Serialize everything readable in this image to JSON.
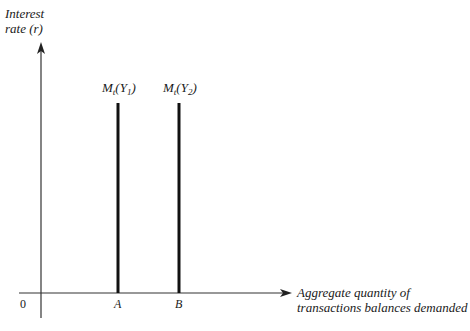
{
  "diagram": {
    "type": "money-demand-transactions",
    "y_axis": {
      "label_line1": "Interest",
      "label_line2": "rate (r)"
    },
    "x_axis": {
      "label_line1": "Aggregate quantity of",
      "label_line2": "transactions balances demanded"
    },
    "origin": "0",
    "curves": [
      {
        "name": "M",
        "subscript_t": "t",
        "arg": "Y",
        "arg_sub": "1",
        "tick": "A"
      },
      {
        "name": "M",
        "subscript_t": "t",
        "arg": "Y",
        "arg_sub": "2",
        "tick": "B"
      }
    ],
    "colors": {
      "ink": "#1a1a1a",
      "background": "#ffffff"
    }
  }
}
